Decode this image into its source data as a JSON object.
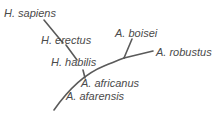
{
  "diagram": {
    "type": "phylogenetic-tree",
    "line_color": "#5a5a5a",
    "text_color": "#4a4a4a",
    "species": [
      {
        "id": "h-sapiens",
        "label": "H. sapiens",
        "x": 4,
        "y": 7
      },
      {
        "id": "h-erectus",
        "label": "H. erectus",
        "x": 41,
        "y": 34
      },
      {
        "id": "h-habilis",
        "label": "H. habilis",
        "x": 51,
        "y": 56
      },
      {
        "id": "a-boisei",
        "label": "A. boisei",
        "x": 115,
        "y": 27
      },
      {
        "id": "a-robustus",
        "label": "A. robustus",
        "x": 156,
        "y": 46
      },
      {
        "id": "a-africanus",
        "label": "A. africanus",
        "x": 81,
        "y": 77
      },
      {
        "id": "a-afarensis",
        "label": "A. afarensis",
        "x": 66,
        "y": 90
      }
    ]
  }
}
